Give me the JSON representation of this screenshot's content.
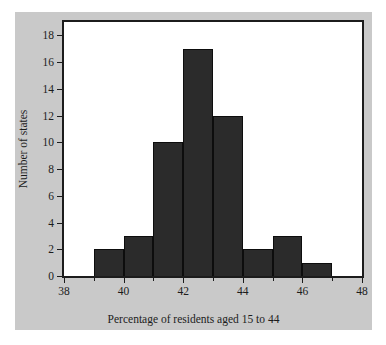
{
  "figure": {
    "background_color": "#c9c9c9",
    "page_background_color": "#ffffff",
    "bar_color": "#2b2b2b",
    "axis_color": "#1c1c1c"
  },
  "chart_data": {
    "type": "bar",
    "title": "",
    "xlabel": "Percentage of residents aged 15 to 44",
    "ylabel": "Number of states",
    "xlim": [
      38,
      48
    ],
    "ylim": [
      0,
      19
    ],
    "grid": false,
    "legend": null,
    "bin_width": 1,
    "x_major_ticks": [
      38,
      40,
      42,
      44,
      46,
      48
    ],
    "x_major_tick_labels": [
      "38",
      "40",
      "42",
      "44",
      "46",
      "48"
    ],
    "x_minor_ticks": [
      39,
      41,
      43,
      45,
      47
    ],
    "y_ticks": [
      0,
      2,
      4,
      6,
      8,
      10,
      12,
      14,
      16,
      18
    ],
    "y_tick_labels": [
      "0",
      "2",
      "4",
      "6",
      "8",
      "10",
      "12",
      "14",
      "16",
      "18"
    ],
    "bins": [
      {
        "left": 39,
        "right": 40,
        "count": 2
      },
      {
        "left": 40,
        "right": 41,
        "count": 3
      },
      {
        "left": 41,
        "right": 42,
        "count": 10
      },
      {
        "left": 42,
        "right": 43,
        "count": 17
      },
      {
        "left": 43,
        "right": 44,
        "count": 12
      },
      {
        "left": 44,
        "right": 45,
        "count": 2
      },
      {
        "left": 45,
        "right": 46,
        "count": 3
      },
      {
        "left": 46,
        "right": 47,
        "count": 1
      }
    ],
    "categories": [
      "39-40",
      "40-41",
      "41-42",
      "42-43",
      "43-44",
      "44-45",
      "45-46",
      "46-47"
    ],
    "values": [
      2,
      3,
      10,
      17,
      12,
      2,
      3,
      1
    ]
  }
}
